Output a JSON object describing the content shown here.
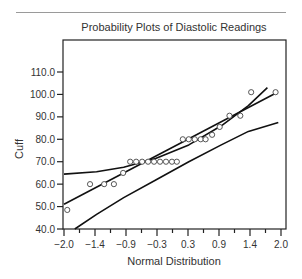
{
  "chart_data": {
    "type": "scatter",
    "title": "Probability Plots of Diastolic Readings",
    "xlabel": "Normal Distribution",
    "ylabel": "Cuff",
    "xlim": [
      -2.0,
      2.0
    ],
    "ylim": [
      40.0,
      110.0
    ],
    "x_ticks": [
      "-2.0",
      "-1.4",
      "-0.9",
      "-0.3",
      "0.3",
      "0.9",
      "1.4",
      "2.0"
    ],
    "y_ticks": [
      "40.0",
      "50.0",
      "60.0",
      "70.0",
      "80.0",
      "90.0",
      "100.0",
      "110.0"
    ],
    "grid": false,
    "legend": null,
    "series": [
      {
        "name": "Observed",
        "marker": "open-circle",
        "points": [
          [
            -1.94,
            48.5
          ],
          [
            -1.52,
            60.0
          ],
          [
            -1.26,
            60.0
          ],
          [
            -1.08,
            60.0
          ],
          [
            -0.91,
            65.0
          ],
          [
            -0.78,
            70.0
          ],
          [
            -0.67,
            70.0
          ],
          [
            -0.56,
            70.0
          ],
          [
            -0.45,
            70.0
          ],
          [
            -0.34,
            70.0
          ],
          [
            -0.23,
            70.0
          ],
          [
            -0.12,
            70.0
          ],
          [
            -0.01,
            70.0
          ],
          [
            0.08,
            70.0
          ],
          [
            0.19,
            80.0
          ],
          [
            0.3,
            80.0
          ],
          [
            0.41,
            80.0
          ],
          [
            0.52,
            80.0
          ],
          [
            0.61,
            80.0
          ],
          [
            0.73,
            82.0
          ],
          [
            0.87,
            85.5
          ],
          [
            1.05,
            90.5
          ],
          [
            1.25,
            90.5
          ],
          [
            1.45,
            101.0
          ],
          [
            1.9,
            101.0
          ]
        ]
      },
      {
        "name": "Fit line",
        "type": "line",
        "points": [
          [
            -2.0,
            51.0
          ],
          [
            1.9,
            100.5
          ]
        ]
      },
      {
        "name": "Upper confidence band",
        "type": "line",
        "points": [
          [
            -2.0,
            64.5
          ],
          [
            -1.4,
            65.5
          ],
          [
            -0.9,
            67.5
          ],
          [
            -0.3,
            71.5
          ],
          [
            0.3,
            77.5
          ],
          [
            0.9,
            86.0
          ],
          [
            1.4,
            95.0
          ],
          [
            1.75,
            103.0
          ]
        ]
      },
      {
        "name": "Lower confidence band",
        "type": "line",
        "points": [
          [
            -1.8,
            40.0
          ],
          [
            -1.4,
            46.5
          ],
          [
            -0.9,
            54.0
          ],
          [
            -0.3,
            62.0
          ],
          [
            0.3,
            70.0
          ],
          [
            0.9,
            77.5
          ],
          [
            1.4,
            83.5
          ],
          [
            1.95,
            87.5
          ]
        ]
      }
    ]
  }
}
